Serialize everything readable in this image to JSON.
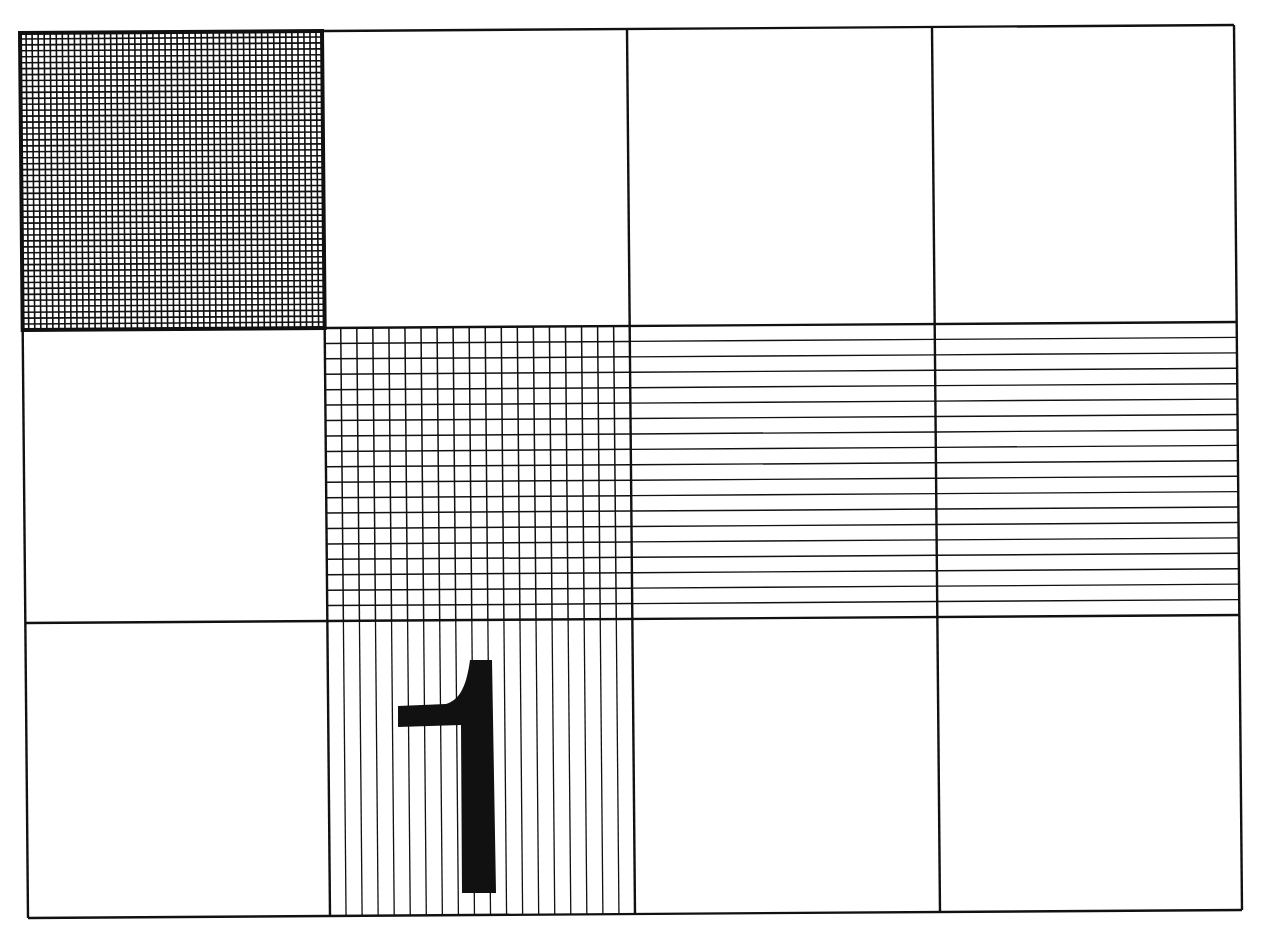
{
  "colors": {
    "ink": "#111111",
    "paper": "#ffffff"
  },
  "grid": {
    "columns": 4,
    "rows": 3,
    "corners": {
      "top_left": [
        20,
        33
      ],
      "top_right": [
        1234,
        25
      ],
      "bottom_left": [
        28,
        918
      ],
      "bottom_right": [
        1245,
        906
      ]
    },
    "local_size": [
      1214,
      885
    ],
    "column_edges": [
      0,
      302,
      607,
      912,
      1214
    ],
    "row_edges": [
      0,
      297,
      590,
      885
    ],
    "border_width": 2.4
  },
  "cells": [
    {
      "row": 0,
      "col": 0,
      "pattern": "grid",
      "divisions_x": 50,
      "divisions_y": 50,
      "line_width": 1.6,
      "heavy_border": true
    },
    {
      "row": 0,
      "col": 1,
      "pattern": "empty"
    },
    {
      "row": 0,
      "col": 2,
      "pattern": "empty"
    },
    {
      "row": 0,
      "col": 3,
      "pattern": "empty"
    },
    {
      "row": 1,
      "col": 0,
      "pattern": "empty"
    },
    {
      "row": 1,
      "col": 1,
      "pattern": "grid",
      "divisions_x": 19,
      "divisions_y": 19,
      "line_width": 1.5
    },
    {
      "row": 1,
      "col": 2,
      "pattern": "horizontal",
      "divisions_y": 19,
      "line_width": 1.4
    },
    {
      "row": 1,
      "col": 3,
      "pattern": "horizontal",
      "divisions_y": 19,
      "line_width": 1.4
    },
    {
      "row": 2,
      "col": 0,
      "pattern": "empty"
    },
    {
      "row": 2,
      "col": 1,
      "pattern": "vertical",
      "divisions_x": 19,
      "line_width": 1.3
    },
    {
      "row": 2,
      "col": 2,
      "pattern": "empty"
    },
    {
      "row": 2,
      "col": 3,
      "pattern": "empty"
    }
  ],
  "label": {
    "text": "1",
    "cell": {
      "row": 2,
      "col": 1
    },
    "glyph_path": "M 398 706 L 446 704 C 458 700 466 690 470 660 L 492 660 L 496 893 L 462 893 L 461 725 L 398 727 Z"
  }
}
